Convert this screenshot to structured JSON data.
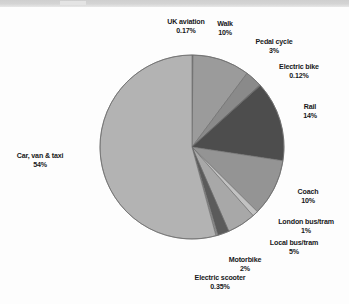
{
  "chart_data": {
    "type": "pie",
    "title": "",
    "subtitle": "",
    "xlabel": "",
    "ylabel": "",
    "legend": "none",
    "grid": false,
    "labels_show_percent": true,
    "start_angle_deg": 0,
    "direction": "clockwise",
    "categories": [
      "UK aviation",
      "Walk",
      "Pedal cycle",
      "Electric bike",
      "Rail",
      "Coach",
      "London bus/tram",
      "Local bus/tram",
      "Motorbike",
      "Electric scooter",
      "Car, van & taxi"
    ],
    "values": [
      0.17,
      10,
      3,
      0.12,
      14,
      10,
      1,
      5,
      2,
      0.35,
      54
    ],
    "value_labels": [
      "0.17%",
      "10%",
      "3%",
      "0.12%",
      "14%",
      "10%",
      "1%",
      "5%",
      "2%",
      "0.35%",
      "54%"
    ],
    "colors": [
      "#8f8f8f",
      "#9b9b9b",
      "#8a8a8a",
      "#6f6f6f",
      "#4d4d4d",
      "#949494",
      "#c2c2c2",
      "#a8a8a8",
      "#5b5b5b",
      "#8e8e8e",
      "#b3b3b3"
    ],
    "slices": [
      {
        "name": "UK aviation",
        "value": 0.17,
        "value_label": "0.17%",
        "color": "#8f8f8f"
      },
      {
        "name": "Walk",
        "value": 10,
        "value_label": "10%",
        "color": "#9b9b9b"
      },
      {
        "name": "Pedal cycle",
        "value": 3,
        "value_label": "3%",
        "color": "#8a8a8a"
      },
      {
        "name": "Electric bike",
        "value": 0.12,
        "value_label": "0.12%",
        "color": "#6f6f6f"
      },
      {
        "name": "Rail",
        "value": 14,
        "value_label": "14%",
        "color": "#4d4d4d"
      },
      {
        "name": "Coach",
        "value": 10,
        "value_label": "10%",
        "color": "#949494"
      },
      {
        "name": "London bus/tram",
        "value": 1,
        "value_label": "1%",
        "color": "#c2c2c2"
      },
      {
        "name": "Local bus/tram",
        "value": 5,
        "value_label": "5%",
        "color": "#a8a8a8"
      },
      {
        "name": "Motorbike",
        "value": 2,
        "value_label": "2%",
        "color": "#5b5b5b"
      },
      {
        "name": "Electric scooter",
        "value": 0.35,
        "value_label": "0.35%",
        "color": "#8e8e8e"
      },
      {
        "name": "Car, van & taxi",
        "value": 54,
        "value_label": "54%",
        "color": "#b3b3b3"
      }
    ]
  },
  "geometry": {
    "center_x": 192,
    "center_y": 147,
    "radius": 92,
    "stroke_color": "#6a6a6a",
    "stroke_width": 0.6
  }
}
